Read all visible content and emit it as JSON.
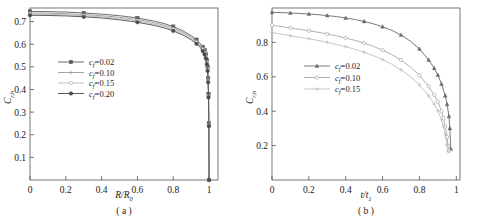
{
  "figure": {
    "panels": [
      {
        "caption": "( a )",
        "xlabel_main": "R/R",
        "xlabel_sub": "0",
        "ylabel_main": "C",
        "ylabel_sub": "r,h",
        "xticks": [
          "0",
          "0.2",
          "0.4",
          "0.6",
          "0.8",
          "1"
        ],
        "yticks": [
          "0.1",
          "0.2",
          "0.3",
          "0.4",
          "0.5",
          "0.6",
          "0.7"
        ],
        "legend": [
          {
            "label_var": "c",
            "label_sub": "f",
            "label_val": "=0.02",
            "marker": "filled-square",
            "color": "#5a5a5a"
          },
          {
            "label_var": "c",
            "label_sub": "f",
            "label_val": "=0.10",
            "marker": "plus",
            "color": "#9a9a9a"
          },
          {
            "label_var": "c",
            "label_sub": "f",
            "label_val": "=0.15",
            "marker": "open-circle",
            "color": "#b5b5b5"
          },
          {
            "label_var": "c",
            "label_sub": "f",
            "label_val": "=0.20",
            "marker": "filled-circle",
            "color": "#4a4a4a"
          }
        ]
      },
      {
        "caption": "( b )",
        "xlabel_main": "t/t",
        "xlabel_sub": "1",
        "ylabel_main": "C",
        "ylabel_sub": "r,h",
        "xticks": [
          "0",
          "0.2",
          "0.4",
          "0.6",
          "0.8",
          "1"
        ],
        "yticks": [
          "0.2",
          "0.4",
          "0.6",
          "0.8"
        ],
        "legend": [
          {
            "label_var": "c",
            "label_sub": "f",
            "label_val": "=0.02",
            "marker": "filled-triangle",
            "color": "#6a6a6a"
          },
          {
            "label_var": "c",
            "label_sub": "f",
            "label_val": "=0.10",
            "marker": "open-circle",
            "color": "#a8a8a8"
          },
          {
            "label_var": "c",
            "label_sub": "f",
            "label_val": "=0.15",
            "marker": "plus",
            "color": "#c0c0c0"
          }
        ]
      }
    ]
  },
  "chart_data": [
    {
      "type": "line",
      "title": "",
      "panel": "(a)",
      "xlabel": "R/R0",
      "ylabel": "C r,h",
      "xlim": [
        0,
        1.05
      ],
      "ylim": [
        0,
        0.76
      ],
      "grid": false,
      "legend_position": "center-left",
      "xticks": [
        0,
        0.2,
        0.4,
        0.6,
        0.8,
        1
      ],
      "yticks": [
        0.1,
        0.2,
        0.3,
        0.4,
        0.5,
        0.6,
        0.7
      ],
      "series": [
        {
          "name": "c_f=0.02",
          "marker": "filled-square",
          "color": "#5a5a5a",
          "x": [
            0,
            0.1,
            0.2,
            0.3,
            0.4,
            0.5,
            0.6,
            0.7,
            0.75,
            0.8,
            0.85,
            0.9,
            0.93,
            0.95,
            0.965,
            0.975,
            0.982,
            0.988,
            0.992,
            0.995,
            0.997,
            0.999,
            1.0
          ],
          "y": [
            0.745,
            0.744,
            0.742,
            0.738,
            0.733,
            0.726,
            0.716,
            0.701,
            0.691,
            0.678,
            0.661,
            0.638,
            0.62,
            0.604,
            0.588,
            0.573,
            0.556,
            0.53,
            0.5,
            0.45,
            0.38,
            0.25,
            0.0
          ]
        },
        {
          "name": "c_f=0.10",
          "marker": "plus",
          "color": "#9a9a9a",
          "x": [
            0,
            0.1,
            0.2,
            0.3,
            0.4,
            0.5,
            0.6,
            0.7,
            0.75,
            0.8,
            0.85,
            0.9,
            0.93,
            0.95,
            0.965,
            0.975,
            0.982,
            0.988,
            0.992,
            0.995,
            0.997,
            0.999,
            1.0
          ],
          "y": [
            0.738,
            0.737,
            0.735,
            0.731,
            0.726,
            0.719,
            0.709,
            0.694,
            0.684,
            0.671,
            0.654,
            0.632,
            0.614,
            0.598,
            0.582,
            0.567,
            0.55,
            0.524,
            0.494,
            0.444,
            0.375,
            0.245,
            0.0
          ]
        },
        {
          "name": "c_f=0.15",
          "marker": "open-circle",
          "color": "#b5b5b5",
          "x": [
            0,
            0.1,
            0.2,
            0.3,
            0.4,
            0.5,
            0.6,
            0.7,
            0.75,
            0.8,
            0.85,
            0.9,
            0.93,
            0.95,
            0.965,
            0.975,
            0.982,
            0.988,
            0.992,
            0.995,
            0.997,
            0.999,
            1.0
          ],
          "y": [
            0.733,
            0.732,
            0.73,
            0.726,
            0.721,
            0.714,
            0.703,
            0.688,
            0.678,
            0.665,
            0.648,
            0.626,
            0.608,
            0.592,
            0.576,
            0.561,
            0.544,
            0.518,
            0.488,
            0.438,
            0.37,
            0.242,
            0.0
          ]
        },
        {
          "name": "c_f=0.20",
          "marker": "filled-circle",
          "color": "#4a4a4a",
          "x": [
            0,
            0.1,
            0.2,
            0.3,
            0.4,
            0.5,
            0.6,
            0.7,
            0.75,
            0.8,
            0.85,
            0.9,
            0.93,
            0.95,
            0.965,
            0.975,
            0.982,
            0.988,
            0.992,
            0.995,
            0.997,
            0.999,
            1.0
          ],
          "y": [
            0.728,
            0.727,
            0.725,
            0.721,
            0.716,
            0.708,
            0.697,
            0.682,
            0.672,
            0.659,
            0.642,
            0.62,
            0.602,
            0.586,
            0.57,
            0.555,
            0.538,
            0.512,
            0.482,
            0.432,
            0.365,
            0.238,
            0.0
          ]
        }
      ]
    },
    {
      "type": "line",
      "title": "",
      "panel": "(b)",
      "xlabel": "t/t1",
      "ylabel": "C r,h",
      "xlim": [
        0,
        1.02
      ],
      "ylim": [
        0,
        1.0
      ],
      "grid": false,
      "legend_position": "center-left",
      "xticks": [
        0,
        0.2,
        0.4,
        0.6,
        0.8,
        1
      ],
      "yticks": [
        0.2,
        0.4,
        0.6,
        0.8
      ],
      "series": [
        {
          "name": "c_f=0.02",
          "marker": "filled-triangle",
          "color": "#6a6a6a",
          "x": [
            0,
            0.05,
            0.1,
            0.15,
            0.2,
            0.25,
            0.3,
            0.35,
            0.4,
            0.45,
            0.5,
            0.55,
            0.6,
            0.65,
            0.7,
            0.75,
            0.8,
            0.85,
            0.88,
            0.9,
            0.92,
            0.94,
            0.95,
            0.96,
            0.965,
            0.97
          ],
          "y": [
            0.975,
            0.973,
            0.971,
            0.968,
            0.965,
            0.961,
            0.956,
            0.95,
            0.942,
            0.933,
            0.922,
            0.908,
            0.891,
            0.87,
            0.843,
            0.808,
            0.762,
            0.698,
            0.65,
            0.61,
            0.558,
            0.49,
            0.44,
            0.37,
            0.3,
            0.18
          ]
        },
        {
          "name": "c_f=0.10",
          "marker": "open-circle",
          "color": "#a8a8a8",
          "x": [
            0,
            0.05,
            0.1,
            0.15,
            0.2,
            0.25,
            0.3,
            0.35,
            0.4,
            0.45,
            0.5,
            0.55,
            0.6,
            0.65,
            0.7,
            0.75,
            0.8,
            0.85,
            0.88,
            0.9,
            0.92,
            0.93,
            0.94,
            0.95,
            0.955,
            0.96
          ],
          "y": [
            0.9,
            0.892,
            0.884,
            0.876,
            0.868,
            0.859,
            0.849,
            0.838,
            0.826,
            0.812,
            0.796,
            0.777,
            0.755,
            0.729,
            0.697,
            0.658,
            0.609,
            0.544,
            0.495,
            0.455,
            0.4,
            0.36,
            0.312,
            0.25,
            0.2,
            0.17
          ]
        },
        {
          "name": "c_f=0.15",
          "marker": "plus",
          "color": "#c0c0c0",
          "x": [
            0,
            0.05,
            0.1,
            0.15,
            0.2,
            0.25,
            0.3,
            0.35,
            0.4,
            0.45,
            0.5,
            0.55,
            0.6,
            0.65,
            0.7,
            0.75,
            0.8,
            0.85,
            0.88,
            0.9,
            0.92,
            0.93,
            0.94,
            0.95,
            0.955
          ],
          "y": [
            0.857,
            0.848,
            0.839,
            0.83,
            0.821,
            0.811,
            0.8,
            0.788,
            0.775,
            0.76,
            0.743,
            0.723,
            0.7,
            0.673,
            0.641,
            0.602,
            0.553,
            0.489,
            0.442,
            0.403,
            0.35,
            0.312,
            0.265,
            0.205,
            0.165
          ]
        }
      ]
    }
  ]
}
